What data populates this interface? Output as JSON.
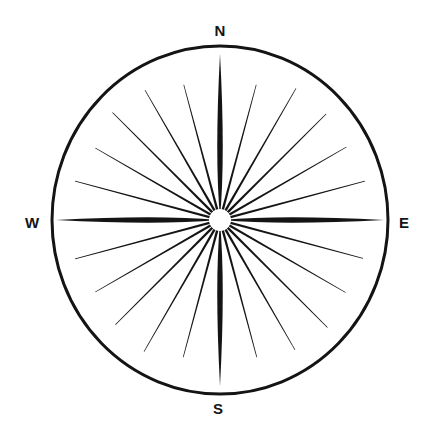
{
  "figure": {
    "name": "compass-rose",
    "background_color": "#ffffff",
    "ink_color": "#141414"
  },
  "circle": {
    "center_x": 220,
    "center_y": 220,
    "radius_x": 168,
    "radius_y": 174,
    "stroke_width": 3,
    "stroke_color": "#141414",
    "fill": "none"
  },
  "hub": {
    "radius": 11,
    "fill": "#ffffff"
  },
  "labels": [
    {
      "id": "north",
      "text": "N",
      "x": 220,
      "y": 36,
      "anchor": "middle"
    },
    {
      "id": "east",
      "text": "E",
      "x": 404,
      "y": 228,
      "anchor": "middle"
    },
    {
      "id": "south",
      "text": "S",
      "x": 218,
      "y": 414,
      "anchor": "middle"
    },
    {
      "id": "west",
      "text": "W",
      "x": 32,
      "y": 228,
      "anchor": "middle"
    }
  ],
  "cardinal_spikes": [
    {
      "id": "spike-n",
      "bearing_deg": 0,
      "label": "N",
      "length": 166,
      "half_width": 5.5,
      "fill": "#141414"
    },
    {
      "id": "spike-e",
      "bearing_deg": 90,
      "label": "E",
      "length": 164,
      "half_width": 5.5,
      "fill": "#141414"
    },
    {
      "id": "spike-s",
      "bearing_deg": 180,
      "label": "S",
      "length": 166,
      "half_width": 5.5,
      "fill": "#141414"
    },
    {
      "id": "spike-w",
      "bearing_deg": 270,
      "label": "W",
      "length": 164,
      "half_width": 5.5,
      "fill": "#141414"
    }
  ],
  "thin_rays": [
    {
      "bearing_deg": 15,
      "length": 140,
      "width": 2.4
    },
    {
      "bearing_deg": 30,
      "length": 152,
      "width": 2.4
    },
    {
      "bearing_deg": 45,
      "length": 150,
      "width": 2.4
    },
    {
      "bearing_deg": 60,
      "length": 146,
      "width": 2.4
    },
    {
      "bearing_deg": 75,
      "length": 150,
      "width": 2.4
    },
    {
      "bearing_deg": 105,
      "length": 148,
      "width": 2.4
    },
    {
      "bearing_deg": 120,
      "length": 145,
      "width": 2.4
    },
    {
      "bearing_deg": 135,
      "length": 152,
      "width": 2.4
    },
    {
      "bearing_deg": 150,
      "length": 150,
      "width": 2.4
    },
    {
      "bearing_deg": 165,
      "length": 142,
      "width": 2.4
    },
    {
      "bearing_deg": 195,
      "length": 142,
      "width": 2.4
    },
    {
      "bearing_deg": 210,
      "length": 152,
      "width": 2.4
    },
    {
      "bearing_deg": 225,
      "length": 148,
      "width": 2.4
    },
    {
      "bearing_deg": 240,
      "length": 144,
      "width": 2.4
    },
    {
      "bearing_deg": 255,
      "length": 150,
      "width": 2.4
    },
    {
      "bearing_deg": 285,
      "length": 150,
      "width": 2.4
    },
    {
      "bearing_deg": 300,
      "length": 144,
      "width": 2.4
    },
    {
      "bearing_deg": 315,
      "length": 152,
      "width": 2.4
    },
    {
      "bearing_deg": 330,
      "length": 150,
      "width": 2.4
    },
    {
      "bearing_deg": 345,
      "length": 140,
      "width": 2.4
    }
  ]
}
